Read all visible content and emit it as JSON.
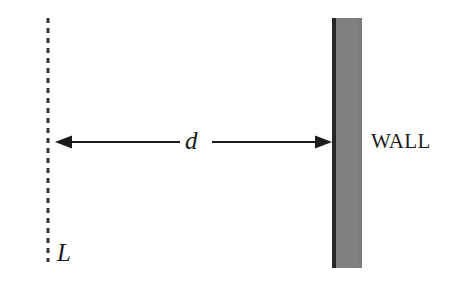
{
  "figure": {
    "type": "physics-schematic",
    "title": "",
    "background_color": "#ffffff",
    "width": 461,
    "height": 288
  },
  "labels": {
    "distance": "d",
    "line_label": "L",
    "wall_label": "WALL"
  },
  "elements": {
    "dashed_line": {
      "name": "L",
      "orientation": "vertical",
      "x": 48,
      "y_top": 18,
      "y_bottom": 262,
      "dash_on": 5,
      "dash_off": 5,
      "stroke_width": 3,
      "color": "#333333"
    },
    "wall": {
      "label": "WALL",
      "x_left": 332,
      "x_right": 362,
      "y_top": 18,
      "y_bottom": 268,
      "fill_color": "#808080",
      "edge_color": "#262626",
      "edge_width": 4
    },
    "dimension_arrow": {
      "label": "d",
      "orientation": "horizontal",
      "y": 142,
      "x_start": 55,
      "x_end": 332,
      "double_headed": true,
      "color": "#1c1c1c",
      "stroke_width": 2,
      "label_gap_start": 180,
      "label_gap_end": 212
    }
  },
  "colors": {
    "ink": "#1c1c1c",
    "wall_gray": "#808080",
    "wall_edge": "#262626",
    "background": "#ffffff"
  }
}
